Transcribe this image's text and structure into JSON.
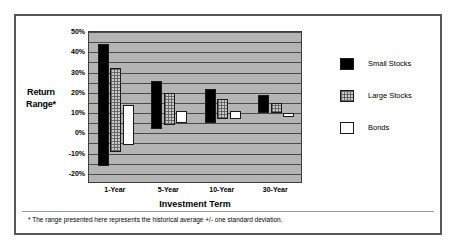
{
  "chart_data": {
    "type": "bar",
    "bar_style": "floating-range",
    "title": "",
    "xlabel": "Investment Term",
    "ylabel": "Return Range*",
    "categories": [
      "1-Year",
      "5-Year",
      "10-Year",
      "30-Year"
    ],
    "ylim": [
      -25,
      50
    ],
    "ytick_labels": [
      "50%",
      "40%",
      "30%",
      "20%",
      "10%",
      "0%",
      "-10%",
      "-20%"
    ],
    "ytick_values": [
      50,
      40,
      30,
      20,
      10,
      0,
      -10,
      -20
    ],
    "gridlines": [
      50,
      45,
      40,
      35,
      30,
      25,
      20,
      15,
      10,
      5,
      0,
      -5,
      -10,
      -15,
      -20,
      -25
    ],
    "grid": true,
    "legend_position": "right",
    "series": [
      {
        "name": "Small Stocks",
        "color": "#000000",
        "ranges": [
          {
            "category": "1-Year",
            "low": -16,
            "high": 44
          },
          {
            "category": "5-Year",
            "low": 2,
            "high": 26
          },
          {
            "category": "10-Year",
            "low": 5,
            "high": 22
          },
          {
            "category": "30-Year",
            "low": 10,
            "high": 19
          }
        ]
      },
      {
        "name": "Large Stocks",
        "color": "#c9c9c9",
        "ranges": [
          {
            "category": "1-Year",
            "low": -9,
            "high": 32
          },
          {
            "category": "5-Year",
            "low": 4,
            "high": 20
          },
          {
            "category": "10-Year",
            "low": 7,
            "high": 17
          },
          {
            "category": "30-Year",
            "low": 10,
            "high": 15
          }
        ]
      },
      {
        "name": "Bonds",
        "color": "#ffffff",
        "ranges": [
          {
            "category": "1-Year",
            "low": -6,
            "high": 14
          },
          {
            "category": "5-Year",
            "low": 5,
            "high": 11
          },
          {
            "category": "10-Year",
            "low": 7,
            "high": 11
          },
          {
            "category": "30-Year",
            "low": 8,
            "high": 10
          }
        ]
      }
    ],
    "footnote": "* The range presented here represents the historical average +/- one standard deviation."
  }
}
